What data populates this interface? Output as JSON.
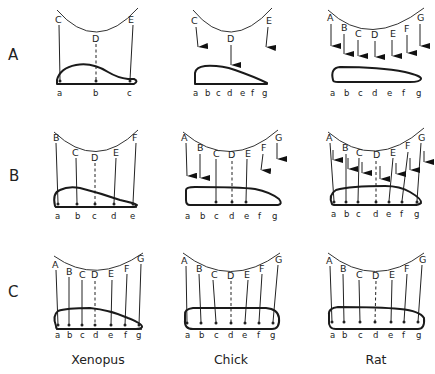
{
  "rows": [
    {
      "label": "A"
    },
    {
      "label": "B"
    },
    {
      "label": "C"
    }
  ],
  "columns": [
    {
      "species": "Xenopus"
    },
    {
      "species": "Chick"
    },
    {
      "species": "Rat"
    }
  ],
  "panels": {
    "A_xenopus": {
      "retina_points": [
        "C",
        "D",
        "E"
      ],
      "tectum_points": [
        "a",
        "b",
        "c"
      ],
      "projection": "lines to tectum, D dashed"
    },
    "A_chick": {
      "retina_points": [
        "C",
        "D",
        "E"
      ],
      "tectum_points": [
        "a",
        "b",
        "c",
        "d",
        "e",
        "f",
        "g"
      ],
      "projection": "arrows, only D reaches tectum"
    },
    "A_rat": {
      "retina_points": [
        "A",
        "B",
        "C",
        "D",
        "E",
        "F",
        "G"
      ],
      "tectum_points": [
        "a",
        "b",
        "c",
        "d",
        "e",
        "f",
        "g"
      ],
      "projection": "arrows, none reach tectum"
    },
    "B_xenopus": {
      "retina_points": [
        "B",
        "C",
        "D",
        "E",
        "F"
      ],
      "tectum_points": [
        "a",
        "b",
        "c",
        "d",
        "e"
      ],
      "projection": "lines to tectum, D dashed"
    },
    "B_chick": {
      "retina_points": [
        "A",
        "B",
        "C",
        "D",
        "E",
        "F",
        "G"
      ],
      "tectum_points": [
        "a",
        "b",
        "c",
        "d",
        "e",
        "f",
        "g"
      ],
      "projection": "A,B arrows to surface; C,D,E lines to c,d,e; F,G arrows short"
    },
    "B_rat": {
      "retina_points": [
        "A",
        "B",
        "C",
        "D",
        "E",
        "F",
        "G"
      ],
      "tectum_points": [
        "a",
        "b",
        "c",
        "d",
        "e",
        "f",
        "g"
      ],
      "projection": "lines to all points plus arrows"
    },
    "C_xenopus": {
      "retina_points": [
        "A",
        "B",
        "C",
        "D",
        "E",
        "F",
        "G"
      ],
      "tectum_points": [
        "a",
        "b",
        "c",
        "d",
        "e",
        "f",
        "g"
      ],
      "projection": "lines to all, D dashed"
    },
    "C_chick": {
      "retina_points": [
        "A",
        "B",
        "C",
        "D",
        "E",
        "F",
        "G"
      ],
      "tectum_points": [
        "a",
        "b",
        "c",
        "d",
        "e",
        "f",
        "g"
      ],
      "projection": "lines to all, D dashed"
    },
    "C_rat": {
      "retina_points": [
        "A",
        "B",
        "C",
        "D",
        "E",
        "F",
        "G"
      ],
      "tectum_points": [
        "a",
        "b",
        "c",
        "d",
        "e",
        "f",
        "g"
      ],
      "projection": "lines to all, D dashed"
    }
  },
  "labels": {
    "A_xenopus": {
      "C": "C",
      "D": "D",
      "E": "E",
      "a": "a",
      "b": "b",
      "c": "c"
    },
    "A_chick": {
      "C": "C",
      "D": "D",
      "E": "E"
    },
    "B_xenopus": {
      "B": "B",
      "C": "C",
      "D": "D",
      "E": "E",
      "F": "F",
      "a": "a",
      "b": "b",
      "c": "c",
      "d": "d",
      "e": "e"
    },
    "seven_upper": [
      "A",
      "B",
      "C",
      "D",
      "E",
      "F",
      "G"
    ],
    "seven_lower": [
      "a",
      "b",
      "c",
      "d",
      "e",
      "f",
      "g"
    ]
  }
}
